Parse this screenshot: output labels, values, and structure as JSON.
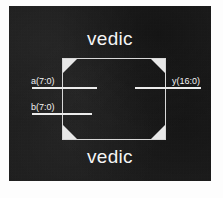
{
  "figure": {
    "kind": "logic-block-diagram",
    "background_color": "#1b1b1b",
    "ink_color": "#f2f2f2",
    "page_color": "#ffffff"
  },
  "titles": {
    "top": "vedic",
    "bottom": "vedic"
  },
  "block": {
    "shape": "chamfered-rectangle",
    "corners": [
      "top-left",
      "top-right",
      "bottom-left",
      "bottom-right"
    ],
    "corner_fill": "#e8e8e8",
    "outline_color": "#d8d8d8"
  },
  "ports": {
    "inputs": [
      {
        "name": "a",
        "label": "a(7:0)",
        "width_bits": 8,
        "msb": 7,
        "lsb": 0,
        "side": "left"
      },
      {
        "name": "b",
        "label": "b(7:0)",
        "width_bits": 8,
        "msb": 7,
        "lsb": 0,
        "side": "left"
      }
    ],
    "outputs": [
      {
        "name": "y",
        "label": "y(16:0)",
        "width_bits": 17,
        "msb": 16,
        "lsb": 0,
        "side": "right"
      }
    ]
  }
}
